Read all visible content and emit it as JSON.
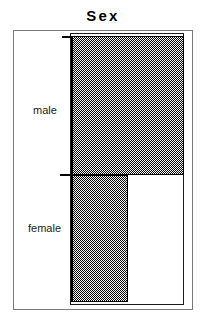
{
  "chart_data": {
    "type": "bar",
    "orientation": "horizontal",
    "title": "Sex",
    "xlabel": "",
    "ylabel": "",
    "categories": [
      "male",
      "female"
    ],
    "values": [
      100,
      50
    ],
    "xlim": [
      0,
      100
    ],
    "grid": false,
    "legend": null,
    "bar_fill": "gray50-checkerboard-dither",
    "bar_fill_color": "#808080",
    "bar_border_color": "#000000",
    "category_band_heights": [
      139,
      127
    ]
  },
  "chart": {
    "title": "Sex",
    "categories": [
      {
        "label": "male",
        "value": 100
      },
      {
        "label": "female",
        "value": 50
      }
    ]
  },
  "colors": {
    "outer_frame": "#7a7a7a",
    "plot_frame": "#1a1a1a",
    "bar_border": "#000000",
    "text": "#000000",
    "background": "#ffffff"
  }
}
